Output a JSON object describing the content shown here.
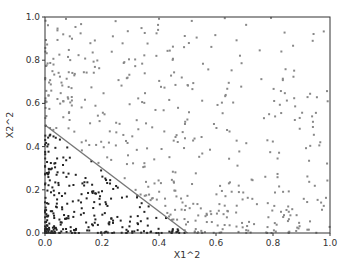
{
  "chart_data": {
    "type": "scatter",
    "title": "",
    "xlabel": "X1^2",
    "ylabel": "X2^2",
    "xlim": [
      0.0,
      1.0
    ],
    "ylim": [
      0.0,
      1.0
    ],
    "xticks": [
      "0.0",
      "0.2",
      "0.4",
      "0.6",
      "0.8",
      "1.0"
    ],
    "yticks": [
      "0.0",
      "0.2",
      "0.4",
      "0.6",
      "0.8",
      "1.0"
    ],
    "grid": false,
    "legend": null,
    "decision_boundary": {
      "type": "line",
      "from": [
        0.0,
        0.5
      ],
      "to": [
        0.5,
        0.0
      ],
      "color": "#777777"
    },
    "series": [
      {
        "name": "inside (x1^2 + x2^2 < 0.5)",
        "color": "#222222",
        "approx_count": 260,
        "distribution": "dense near origin, below boundary line"
      },
      {
        "name": "outside (x1^2 + x2^2 >= 0.5)",
        "color": "#888888",
        "approx_count": 480,
        "distribution": "sparse, above boundary line"
      }
    ],
    "sample_points": {
      "inside": [
        [
          0.02,
          0.45
        ],
        [
          0.05,
          0.44
        ],
        [
          0.08,
          0.4
        ],
        [
          0.12,
          0.35
        ],
        [
          0.18,
          0.28
        ],
        [
          0.22,
          0.25
        ],
        [
          0.25,
          0.22
        ],
        [
          0.3,
          0.18
        ],
        [
          0.35,
          0.12
        ],
        [
          0.4,
          0.08
        ],
        [
          0.45,
          0.03
        ],
        [
          0.01,
          0.3
        ],
        [
          0.03,
          0.2
        ],
        [
          0.06,
          0.15
        ],
        [
          0.1,
          0.1
        ],
        [
          0.15,
          0.05
        ],
        [
          0.2,
          0.02
        ],
        [
          0.02,
          0.02
        ],
        [
          0.04,
          0.06
        ],
        [
          0.07,
          0.03
        ]
      ],
      "outside": [
        [
          0.1,
          0.95
        ],
        [
          0.3,
          0.9
        ],
        [
          0.55,
          0.85
        ],
        [
          0.8,
          0.8
        ],
        [
          0.95,
          0.7
        ],
        [
          0.6,
          0.55
        ],
        [
          0.7,
          0.4
        ],
        [
          0.85,
          0.3
        ],
        [
          0.9,
          0.1
        ],
        [
          0.65,
          0.05
        ],
        [
          0.2,
          0.75
        ],
        [
          0.4,
          0.65
        ],
        [
          0.5,
          0.4
        ],
        [
          0.75,
          0.2
        ],
        [
          0.02,
          0.6
        ],
        [
          0.03,
          0.8
        ],
        [
          0.25,
          0.5
        ],
        [
          0.45,
          0.3
        ],
        [
          0.58,
          0.15
        ],
        [
          0.98,
          0.95
        ]
      ]
    }
  },
  "colors": {
    "inside": "#222222",
    "outside": "#888888",
    "boundary": "#777777",
    "axis": "#333333"
  }
}
